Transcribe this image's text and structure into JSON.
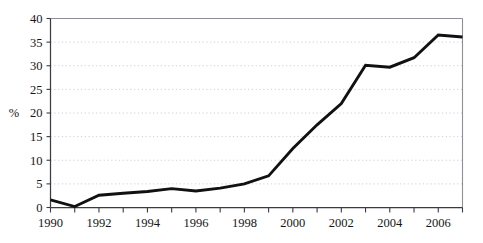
{
  "chart_data": {
    "type": "line",
    "title": "",
    "subtitle": "",
    "xlabel": "",
    "ylabel": "%",
    "x": [
      1990,
      1991,
      1992,
      1993,
      1994,
      1995,
      1996,
      1997,
      1998,
      1999,
      2000,
      2001,
      2002,
      2003,
      2004,
      2005,
      2006,
      2007
    ],
    "values": [
      1.6,
      0.2,
      2.6,
      3.0,
      3.4,
      4.0,
      3.5,
      4.1,
      5.0,
      6.7,
      12.5,
      17.5,
      22.0,
      30.1,
      29.7,
      31.7,
      36.5,
      36.1
    ],
    "series": [
      {
        "name": "",
        "values": [
          1.6,
          0.2,
          2.6,
          3.0,
          3.4,
          4.0,
          3.5,
          4.1,
          5.0,
          6.7,
          12.5,
          17.5,
          22.0,
          30.1,
          29.7,
          31.7,
          36.5,
          36.1
        ]
      }
    ],
    "xlim": [
      1990,
      2007
    ],
    "ylim": [
      0,
      40
    ],
    "y_ticks": [
      0,
      5,
      10,
      15,
      20,
      25,
      30,
      35,
      40
    ],
    "y_tick_labels": [
      "0",
      "5",
      "10",
      "15",
      "20",
      "25",
      "30",
      "35",
      "40"
    ],
    "x_ticks": [
      1990,
      1991,
      1992,
      1993,
      1994,
      1995,
      1996,
      1997,
      1998,
      1999,
      2000,
      2001,
      2002,
      2003,
      2004,
      2005,
      2006,
      2007
    ],
    "x_tick_labels": [
      "1990",
      "",
      "1992",
      "",
      "1994",
      "",
      "1996",
      "",
      "1998",
      "",
      "2000",
      "",
      "2002",
      "",
      "2004",
      "",
      "2006",
      ""
    ],
    "x_labeled_ticks": [
      {
        "value": 1990,
        "label": "1990"
      },
      {
        "value": 1992,
        "label": "1992"
      },
      {
        "value": 1994,
        "label": "1994"
      },
      {
        "value": 1996,
        "label": "1996"
      },
      {
        "value": 1998,
        "label": "1998"
      },
      {
        "value": 2000,
        "label": "2000"
      },
      {
        "value": 2002,
        "label": "2002"
      },
      {
        "value": 2004,
        "label": "2004"
      },
      {
        "value": 2006,
        "label": "2006"
      }
    ],
    "grid": {
      "horizontal": true,
      "vertical": false,
      "style": "dotted"
    },
    "legend": {
      "visible": false,
      "position": "none"
    },
    "line_color": "#111111",
    "grid_color": "#c9c9d4",
    "axis_color": "#3b3b44",
    "background": "#ffffff"
  }
}
